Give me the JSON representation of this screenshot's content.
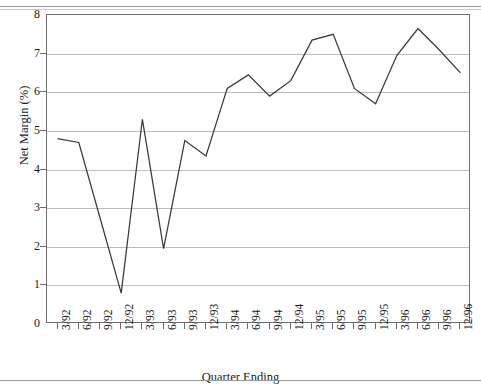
{
  "chart_data": {
    "type": "line",
    "title": "",
    "xlabel": "Quarter Ending",
    "ylabel": "Net Margin (%)",
    "categories": [
      "3/92",
      "6/92",
      "9/92",
      "12/92",
      "3/93",
      "6/93",
      "9/93",
      "12/93",
      "3/94",
      "6/94",
      "9/94",
      "12/94",
      "3/95",
      "6/95",
      "9/95",
      "12/95",
      "3/96",
      "6/96",
      "9/96",
      "12/96"
    ],
    "values": [
      4.8,
      4.7,
      2.75,
      0.8,
      5.3,
      1.95,
      4.75,
      4.35,
      6.1,
      6.45,
      5.9,
      6.3,
      7.35,
      7.5,
      6.1,
      5.7,
      6.95,
      7.65,
      7.1,
      6.5
    ],
    "series": [
      {
        "name": "Net Margin",
        "values": [
          4.8,
          4.7,
          2.75,
          0.8,
          5.3,
          1.95,
          4.75,
          4.35,
          6.1,
          6.45,
          5.9,
          6.3,
          7.35,
          7.5,
          6.1,
          5.7,
          6.95,
          7.65,
          7.1,
          6.5
        ],
        "color": "#3a3a3a"
      }
    ],
    "ylim": [
      0,
      8
    ],
    "yticks": [
      0,
      1,
      2,
      3,
      4,
      5,
      6,
      7,
      8
    ],
    "ytick_labels": [
      "0",
      "1",
      "2",
      "3",
      "4",
      "5",
      "6",
      "7",
      "8"
    ],
    "grid": true,
    "grid_axis": "y",
    "legend": false,
    "legend_position": "none",
    "line_color": "#3a3a3a",
    "grid_color": "#bdbdbd",
    "axis_color": "#6e6e6e",
    "background": "#ffffff"
  },
  "figure": {
    "title_remnant": "",
    "has_top_rule": true,
    "has_bottom_rule": true
  }
}
